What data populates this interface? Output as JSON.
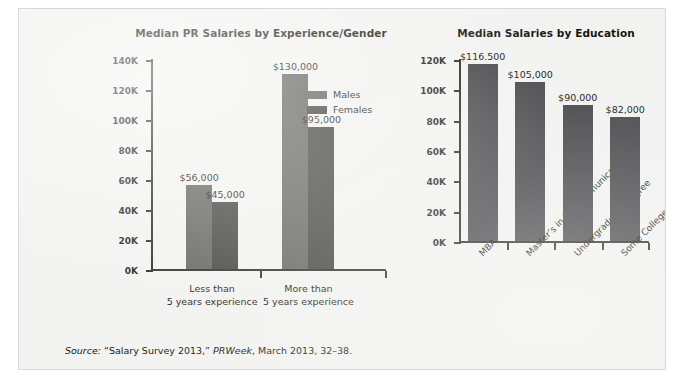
{
  "source_note": {
    "lead": "Source:",
    "title": " “Salary Survey 2013,” ",
    "publication": "PRWeek",
    "rest": ", March 2013, 32–38."
  },
  "colors": {
    "males_bar": "#5d5d5a",
    "females_bar": "#3b3b38",
    "education_bar": "#46464a",
    "axis": "#262620",
    "page_bg": "#f2f2f0"
  },
  "chart_data": [
    {
      "id": "experience_gender",
      "type": "bar",
      "title": "Median PR Salaries by Experience/Gender",
      "xlabel": "",
      "ylabel": "",
      "ylim": [
        0,
        140000
      ],
      "grid": false,
      "legend_position": "inside-right",
      "yticks": [
        0,
        20000,
        40000,
        60000,
        80000,
        100000,
        120000,
        140000
      ],
      "ytick_labels": [
        "0K",
        "20K",
        "40K",
        "60K",
        "80K",
        "100K",
        "120K",
        "140K"
      ],
      "categories": [
        "Less than\n5 years experience",
        "More than\n5 years experience"
      ],
      "category_lines": [
        [
          "Less than",
          "5 years experience"
        ],
        [
          "More than",
          "5 years experience"
        ]
      ],
      "series": [
        {
          "name": "Males",
          "values": [
            56000,
            130000
          ],
          "labels": [
            "$56,000",
            "$130,000"
          ],
          "color": "#5d5d5a"
        },
        {
          "name": "Females",
          "values": [
            45000,
            95000
          ],
          "labels": [
            "$45,000",
            "$95,000"
          ],
          "color": "#3b3b38"
        }
      ]
    },
    {
      "id": "education",
      "type": "bar",
      "title": "Median Salaries by Education",
      "xlabel": "",
      "ylabel": "",
      "ylim": [
        0,
        120000
      ],
      "grid": false,
      "legend_position": "none",
      "yticks": [
        0,
        20000,
        40000,
        60000,
        80000,
        100000,
        120000
      ],
      "ytick_labels": [
        "0K",
        "20K",
        "40K",
        "60K",
        "80K",
        "100K",
        "120K"
      ],
      "categories": [
        "MBA",
        "Master’s in PR/Communications",
        "Undergraduate Degree",
        "Some College"
      ],
      "values": [
        116500,
        105000,
        90000,
        82000
      ],
      "value_labels": [
        "$116.500",
        "$105,000",
        "$90,000",
        "$82,000"
      ],
      "bar_color": "#46464a"
    }
  ]
}
